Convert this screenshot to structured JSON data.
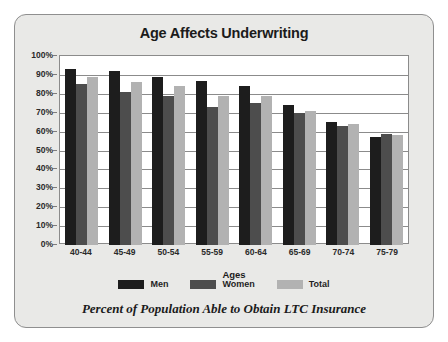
{
  "chart_data": {
    "type": "bar",
    "title": "Age Affects Underwriting",
    "xlabel": "Ages",
    "ylabel": "",
    "ylim": [
      0,
      100
    ],
    "ytick_labels": [
      "100%",
      "90%",
      "80%",
      "70%",
      "60%",
      "50%",
      "40%",
      "30%",
      "20%",
      "10%",
      "0%"
    ],
    "ytick_values": [
      100,
      90,
      80,
      70,
      60,
      50,
      40,
      30,
      20,
      10,
      0
    ],
    "grid": true,
    "legend_position": "bottom",
    "categories": [
      "40-44",
      "45-49",
      "50-54",
      "55-59",
      "60-64",
      "65-69",
      "70-74",
      "75-79"
    ],
    "series": [
      {
        "name": "Men",
        "color": "#1d1d1d",
        "values": [
          93,
          92,
          89,
          87,
          84,
          74,
          65,
          57
        ]
      },
      {
        "name": "Women",
        "color": "#4d4d4d",
        "values": [
          85,
          81,
          79,
          73,
          75,
          70,
          63,
          59
        ]
      },
      {
        "name": "Total",
        "color": "#b2b2b2",
        "values": [
          89,
          86,
          84,
          79,
          79,
          71,
          64,
          58
        ]
      }
    ],
    "caption": "Percent of Population Able to Obtain LTC Insurance"
  },
  "colors": {
    "panel_background": "#e9e9e7",
    "panel_border": "#8f8f8f",
    "plot_background": "#ffffff",
    "gridline": "#8b8b8b"
  }
}
